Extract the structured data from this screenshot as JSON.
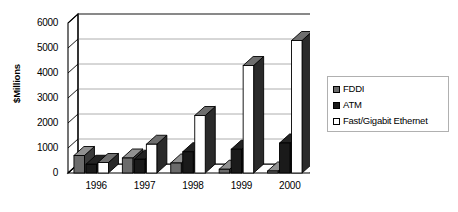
{
  "chart_data": {
    "type": "bar",
    "title": "",
    "subtitle": "",
    "xlabel": "",
    "ylabel": "$Millions",
    "categories": [
      "1996",
      "1997",
      "1998",
      "1999",
      "2000"
    ],
    "series": [
      {
        "name": "FDDI",
        "color": "#6b6b6b",
        "values": [
          700,
          600,
          400,
          150,
          80
        ]
      },
      {
        "name": "ATM",
        "color": "#1a1a1a",
        "values": [
          350,
          550,
          850,
          950,
          1200
        ]
      },
      {
        "name": "Fast/Gigabit Ethernet",
        "color": "#ffffff",
        "values": [
          420,
          1150,
          2300,
          4300,
          5300
        ]
      }
    ],
    "ylim": [
      0,
      6000
    ],
    "ytick_values": [
      0,
      1000,
      2000,
      3000,
      4000,
      5000,
      6000
    ],
    "ytick_labels": [
      "0",
      "1000",
      "2000",
      "3000",
      "4000",
      "5000",
      "6000"
    ],
    "grid": true,
    "grid_axis": "y",
    "legend_position": "right",
    "three_d": true
  },
  "legend": {
    "items": [
      {
        "label": "FDDI",
        "swatch_color": "#6b6b6b"
      },
      {
        "label": "ATM",
        "swatch_color": "#1a1a1a"
      },
      {
        "label": "Fast/Gigabit Ethernet",
        "swatch_color": "#ffffff"
      }
    ]
  },
  "colors": {
    "axis": "#000000",
    "gridline": "#9a9a9a",
    "plot_background": "#ffffff",
    "page_background": "#ffffff",
    "legend_border": "#b0b0b0"
  }
}
